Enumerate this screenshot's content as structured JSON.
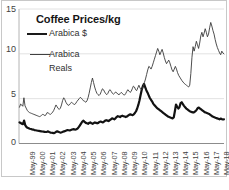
{
  "chart_data": {
    "type": "line",
    "title": "Coffee Prices/kg",
    "xlabel": "",
    "ylabel": "",
    "ylim": [
      0,
      15
    ],
    "yticks": [
      0,
      5,
      10,
      15
    ],
    "ytick_labels": [
      "0",
      "5",
      "10",
      "15"
    ],
    "grid": true,
    "legend_position": "upper-left-inside",
    "x_tick_labels": [
      "May-99",
      "May-00",
      "May-01",
      "May-02",
      "May-03",
      "May-04",
      "May-05",
      "May-06",
      "May-07",
      "May-08",
      "May-09",
      "May-10",
      "May-11",
      "May-12",
      "May-13",
      "May-14",
      "May-15",
      "May-16",
      "May-17",
      "May-18"
    ],
    "x_range": [
      "May-99",
      "May-18"
    ],
    "series": [
      {
        "name": "Arabica $",
        "style": "thick",
        "color": "#121212",
        "values": [
          2.35,
          2.3,
          2.2,
          2.15,
          2.55,
          2.05,
          1.85,
          1.75,
          1.7,
          1.65,
          1.62,
          1.58,
          1.55,
          1.5,
          1.48,
          1.45,
          1.42,
          1.4,
          1.38,
          1.36,
          1.34,
          1.32,
          1.3,
          1.28,
          1.3,
          1.35,
          1.28,
          1.22,
          1.2,
          1.18,
          1.15,
          1.2,
          1.3,
          1.35,
          1.3,
          1.25,
          1.22,
          1.25,
          1.3,
          1.35,
          1.4,
          1.45,
          1.5,
          1.48,
          1.45,
          1.5,
          1.55,
          1.6,
          1.58,
          1.55,
          1.6,
          1.7,
          1.85,
          2.05,
          2.25,
          2.45,
          2.55,
          2.4,
          2.3,
          2.25,
          2.2,
          2.3,
          2.35,
          2.25,
          2.2,
          2.28,
          2.35,
          2.3,
          2.25,
          2.3,
          2.4,
          2.45,
          2.4,
          2.35,
          2.45,
          2.55,
          2.6,
          2.55,
          2.5,
          2.6,
          2.7,
          2.8,
          2.75,
          2.7,
          2.8,
          2.95,
          3.05,
          3.0,
          2.95,
          3.05,
          3.1,
          3.05,
          3.0,
          2.95,
          3.0,
          3.1,
          3.2,
          3.25,
          3.2,
          3.15,
          3.25,
          3.4,
          3.6,
          3.9,
          4.3,
          4.8,
          5.4,
          6.0,
          6.4,
          6.65,
          6.3,
          5.95,
          5.7,
          5.4,
          5.1,
          4.9,
          4.7,
          4.45,
          4.3,
          4.15,
          4.0,
          3.9,
          3.8,
          3.7,
          3.6,
          3.5,
          3.4,
          3.3,
          3.2,
          3.1,
          3.0,
          2.95,
          2.9,
          2.85,
          2.8,
          2.9,
          3.6,
          4.35,
          4.1,
          3.9,
          4.05,
          4.5,
          4.6,
          4.4,
          4.2,
          4.05,
          3.9,
          3.8,
          3.7,
          3.6,
          3.55,
          3.5,
          3.45,
          3.5,
          3.6,
          3.75,
          3.95,
          4.0,
          3.9,
          3.8,
          3.7,
          3.6,
          3.5,
          3.45,
          3.4,
          3.35,
          3.3,
          3.2,
          3.1,
          3.0,
          2.95,
          2.9,
          2.85,
          2.8,
          2.75,
          2.7,
          2.78,
          2.72,
          2.68,
          2.7
        ]
      },
      {
        "name": "Arabica Reals",
        "style": "thin",
        "color": "#3a3a3a",
        "values": [
          4.05,
          4.4,
          4.3,
          4.15,
          5.1,
          4.2,
          3.95,
          3.7,
          3.55,
          3.45,
          3.4,
          3.35,
          3.3,
          3.25,
          3.2,
          3.15,
          3.1,
          3.05,
          3.0,
          3.05,
          3.15,
          3.25,
          3.2,
          3.1,
          3.2,
          3.45,
          3.4,
          3.3,
          3.25,
          3.35,
          3.5,
          3.7,
          4.0,
          4.3,
          4.1,
          3.9,
          3.8,
          3.95,
          4.3,
          4.8,
          5.1,
          4.9,
          4.6,
          4.4,
          4.25,
          4.3,
          4.45,
          4.6,
          4.5,
          4.4,
          4.35,
          4.5,
          4.7,
          4.85,
          5.0,
          5.15,
          5.05,
          4.9,
          4.75,
          4.7,
          4.6,
          4.75,
          5.1,
          5.6,
          6.2,
          6.8,
          7.3,
          6.8,
          6.3,
          5.9,
          5.6,
          5.45,
          5.35,
          5.5,
          5.8,
          6.1,
          6.0,
          5.75,
          5.55,
          5.45,
          5.6,
          5.9,
          6.0,
          5.8,
          5.6,
          5.5,
          5.6,
          5.75,
          5.65,
          5.5,
          5.45,
          5.55,
          5.7,
          5.6,
          5.45,
          5.4,
          5.55,
          5.8,
          6.0,
          5.85,
          5.7,
          5.8,
          6.1,
          6.4,
          6.3,
          6.0,
          5.9,
          6.2,
          6.5,
          6.2,
          6.0,
          6.1,
          6.4,
          6.8,
          7.2,
          7.7,
          8.2,
          8.6,
          8.5,
          8.3,
          8.6,
          9.0,
          9.4,
          9.8,
          10.2,
          10.6,
          10.3,
          9.9,
          10.2,
          10.5,
          10.1,
          9.6,
          9.2,
          8.9,
          9.1,
          9.3,
          9.0,
          8.6,
          8.2,
          8.0,
          8.3,
          8.6,
          8.3,
          7.9,
          7.6,
          7.4,
          7.2,
          7.0,
          6.85,
          6.7,
          6.6,
          6.5,
          6.4,
          6.3,
          6.5,
          7.8,
          9.6,
          10.8,
          10.3,
          10.8,
          11.4,
          11.0,
          10.6,
          11.2,
          12.0,
          12.4,
          11.9,
          12.3,
          12.8,
          12.4,
          11.9,
          12.2,
          12.9,
          13.5,
          13.1,
          12.6,
          12.2,
          11.6,
          11.1,
          10.7,
          10.4,
          10.1,
          9.9,
          10.3,
          10.1,
          10.0
        ]
      }
    ]
  }
}
